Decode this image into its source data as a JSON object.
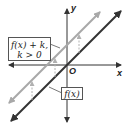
{
  "diagram": {
    "axes": {
      "x_label": "x",
      "y_label": "y",
      "origin_label": "O"
    },
    "curves": [
      {
        "name": "f(x)",
        "label": "f(x)",
        "color": "#333333",
        "description": "line through origin, slope 1"
      },
      {
        "name": "f(x)+k",
        "label_line1": "f(x) + k,",
        "label_line2": "k > 0",
        "color": "#a8a8a8",
        "description": "f(x) shifted up by k"
      }
    ],
    "translation_arrows": {
      "count": 3,
      "direction": "up",
      "style": "dashed",
      "color": "#b0b0b0"
    },
    "colors": {
      "axis": "#333333",
      "original_line": "#333333",
      "translated_line": "#a8a8a8",
      "shift_arrows": "#b0b0b0"
    }
  }
}
